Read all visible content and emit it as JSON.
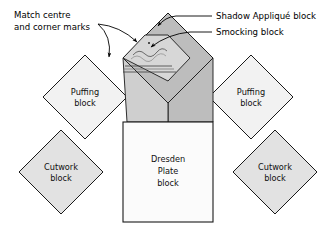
{
  "diagram": {
    "background_color": "#ffffff",
    "colors": {
      "outline": "#1a1a1a",
      "puffing_fill": "#f2f2f2",
      "cutwork_fill": "#e2e2e2",
      "shadow_applique_fill": "#bdbdbd",
      "smocking_fill": "#d7d7d7",
      "dresden_fill": "#fbfbfb",
      "leader_line": "#000000",
      "text": "#000000"
    },
    "blocks": [
      {
        "id": "puffing-left",
        "label_line1": "Puffing",
        "label_line2": "block",
        "shape": "diamond",
        "fill": "#f2f2f2"
      },
      {
        "id": "puffing-right",
        "label_line1": "Puffing",
        "label_line2": "block",
        "shape": "diamond",
        "fill": "#f2f2f2"
      },
      {
        "id": "cutwork-left",
        "label_line1": "Cutwork",
        "label_line2": "block",
        "shape": "diamond",
        "fill": "#e2e2e2"
      },
      {
        "id": "cutwork-right",
        "label_line1": "Cutwork",
        "label_line2": "block",
        "shape": "diamond",
        "fill": "#e2e2e2"
      },
      {
        "id": "dresden-plate",
        "label_line1": "Dresden",
        "label_line2": "Plate",
        "label_line3": "block",
        "shape": "square",
        "fill": "#fbfbfb"
      },
      {
        "id": "shadow-applique",
        "label": "Shadow Appliqué block",
        "shape": "diamond",
        "fill": "#bdbdbd"
      },
      {
        "id": "smocking",
        "label": "Smocking block",
        "shape": "diamond",
        "fill": "#d7d7d7"
      }
    ],
    "callouts": [
      {
        "id": "match-marks",
        "line1": "Match centre",
        "line2": "and corner marks"
      },
      {
        "id": "shadow-applique-callout",
        "text": "Shadow Appliqué block"
      },
      {
        "id": "smocking-callout",
        "text": "Smocking block"
      }
    ]
  }
}
